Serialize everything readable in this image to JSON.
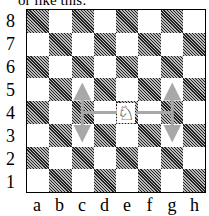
{
  "caption": "or like this:",
  "board": {
    "files": [
      "a",
      "b",
      "c",
      "d",
      "e",
      "f",
      "g",
      "h"
    ],
    "ranks": [
      "8",
      "7",
      "6",
      "5",
      "4",
      "3",
      "2",
      "1"
    ],
    "a1_color": "dark",
    "pieces": [
      {
        "square": "e4",
        "piece": "white-knight",
        "glyph": "♘"
      }
    ],
    "arrows": [
      {
        "from": "e4",
        "to": "c4",
        "type": "line"
      },
      {
        "from": "c4",
        "to": "c5",
        "type": "arrow"
      },
      {
        "from": "c4",
        "to": "c3",
        "type": "arrow"
      },
      {
        "from": "e4",
        "to": "g4",
        "type": "line"
      },
      {
        "from": "g4",
        "to": "g5",
        "type": "arrow"
      },
      {
        "from": "g4",
        "to": "g3",
        "type": "arrow"
      }
    ],
    "arrow_color": "#a8a8a8"
  }
}
